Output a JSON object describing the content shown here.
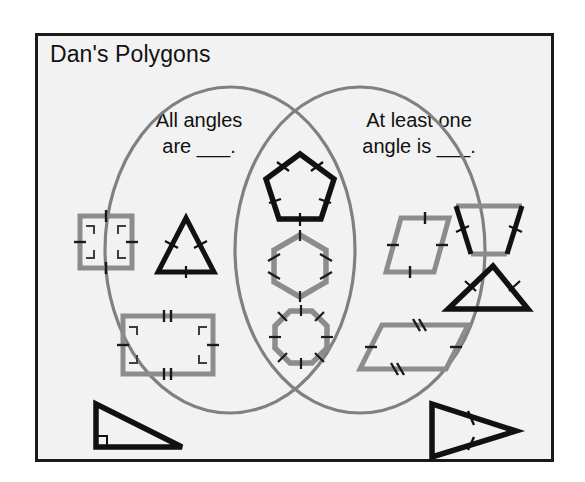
{
  "title": "Dan's Polygons",
  "colors": {
    "frame_border": "#1a1a1a",
    "frame_fill": "#f2f2f2",
    "ellipse_stroke": "#808080",
    "shape_gray": "#8c8c8c",
    "shape_black": "#111111",
    "text": "#111111"
  },
  "venn": {
    "left_label": "All angles\nare ___.",
    "right_label": "At least one\nangle is ___.",
    "left_region_name": "all-angles-region",
    "right_region_name": "at-least-one-angle-region",
    "overlap_region_name": "overlap-region"
  },
  "shapes": {
    "left": [
      {
        "id": "square",
        "name": "square",
        "color": "#8c8c8c",
        "marks": "right-angle marks at 4 corners, single tick on each of 4 sides"
      },
      {
        "id": "equilateral-triangle",
        "name": "equilateral triangle",
        "color": "#111111",
        "marks": "single tick on each of 3 sides"
      },
      {
        "id": "rectangle",
        "name": "rectangle",
        "color": "#8c8c8c",
        "marks": "right-angle marks at 4 corners, single ticks on left and right, double ticks on top and bottom"
      }
    ],
    "overlap": [
      {
        "id": "pentagon",
        "name": "regular pentagon",
        "color": "#111111",
        "marks": "single tick on each of 5 sides"
      },
      {
        "id": "hexagon",
        "name": "regular hexagon",
        "color": "#8c8c8c",
        "marks": "single tick on each of 6 sides"
      },
      {
        "id": "octagon",
        "name": "regular octagon",
        "color": "#8c8c8c",
        "marks": "single tick on each of 8 sides"
      }
    ],
    "right": [
      {
        "id": "rhombus",
        "name": "rhombus",
        "color": "#8c8c8c",
        "marks": "single tick on each of 4 sides"
      },
      {
        "id": "trapezoid",
        "name": "isosceles trapezoid",
        "color": "#111111",
        "marks": "single tick on each leg"
      },
      {
        "id": "obtuse-triangle",
        "name": "isosceles triangle",
        "color": "#111111",
        "marks": "single tick on each of 2 equal sides"
      },
      {
        "id": "parallelogram",
        "name": "parallelogram",
        "color": "#8c8c8c",
        "marks": "single ticks on slanted sides, double ticks on top and bottom"
      }
    ],
    "outside": [
      {
        "id": "right-triangle",
        "name": "right triangle",
        "color": "#111111",
        "marks": "right-angle mark at one vertex"
      },
      {
        "id": "isosceles-arrow-triangle",
        "name": "isosceles triangle",
        "color": "#111111",
        "marks": "single tick on each of 2 equal sides"
      }
    ]
  }
}
